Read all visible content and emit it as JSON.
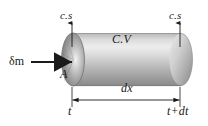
{
  "figure": {
    "background_color": "#ffffff",
    "ink_color": "#1a1a1a",
    "labels": {
      "cs_left": "c.s",
      "cs_right": "c.s",
      "control_volume": "C.V",
      "mass_flow": "δm",
      "area": "A",
      "length": "dx",
      "time_start": "t",
      "time_end": "t+dt"
    },
    "geometry": {
      "cylinder_left_x": 62,
      "cylinder_right_x": 192,
      "cylinder_top_y": 33,
      "cylinder_bottom_y": 86,
      "cap_rx": 11,
      "cap_ry": 26,
      "dimension_line_y": 100,
      "cs_arrow_left_x": 72,
      "cs_arrow_right_x": 180,
      "cs_arrow_top_y": 22,
      "inflow_arrow_y": 62
    },
    "shading": {
      "body_highlight": "#e8e8e8",
      "body_midtone": "#c4c4c4",
      "body_shadow": "#8e8e8e",
      "face_light": "#dcdcdc",
      "face_dark": "#6f6f6f",
      "outline": "#7a7a7a"
    }
  }
}
